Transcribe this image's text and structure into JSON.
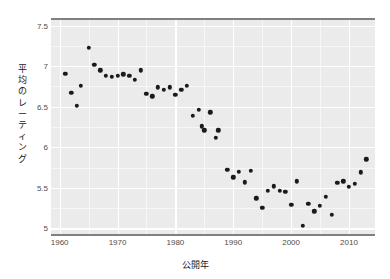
{
  "chart_data": {
    "type": "scatter",
    "title": "",
    "xlabel": "公開年",
    "ylabel": "平均のレーティング",
    "ylabel_chars": [
      "平",
      "均",
      "の",
      "レ",
      "ー",
      "テ",
      "ィ",
      "ン",
      "グ"
    ],
    "xlim": [
      1958.5,
      2014.5
    ],
    "ylim": [
      4.93,
      7.57
    ],
    "xticks": [
      1960,
      1970,
      1980,
      1990,
      2000,
      2010
    ],
    "xticklabels": [
      "1960",
      "1970",
      "1980",
      "1990",
      "2000",
      "2010"
    ],
    "yticks": [
      5,
      5.5,
      6,
      6.5,
      7,
      7.5
    ],
    "yticklabels": [
      "5",
      "5.5",
      "6",
      "6.5",
      "7",
      "7.5"
    ],
    "y_minor_ticks": [
      5.25,
      5.75,
      6.25,
      6.75,
      7.25
    ],
    "x_minor_ticks": [
      1965,
      1975,
      1985,
      1995,
      2005
    ],
    "grid": true,
    "legend": "none",
    "panel_background": "#ebebeb",
    "gridline_color": "#ffffff",
    "point_color": "#1a1a1a",
    "axis_color": "#808080",
    "x": [
      1961,
      1962,
      1963,
      1963.6,
      1965,
      1966,
      1967,
      1968,
      1969,
      1970,
      1971,
      1972,
      1973,
      1974,
      1975,
      1976,
      1977,
      1978,
      1979,
      1980,
      1981,
      1982,
      1983,
      1984,
      1984.6,
      1985,
      1986,
      1987,
      1987.4,
      1989,
      1990,
      1991,
      1992,
      1993,
      1994,
      1995,
      1996,
      1997,
      1998,
      1999,
      2000,
      2001,
      2002,
      2003,
      2004,
      2005,
      2006,
      2007,
      2008,
      2009,
      2010,
      2011,
      2012,
      2013
    ],
    "y": [
      6.91,
      6.67,
      6.51,
      6.76,
      7.23,
      7.02,
      6.95,
      6.88,
      6.87,
      6.88,
      6.9,
      6.88,
      6.83,
      6.95,
      6.66,
      6.63,
      6.74,
      6.71,
      6.74,
      6.65,
      6.71,
      6.76,
      6.39,
      6.46,
      6.26,
      6.21,
      6.43,
      6.12,
      6.21,
      5.72,
      5.63,
      5.7,
      5.57,
      5.71,
      5.37,
      5.25,
      5.46,
      5.52,
      5.46,
      5.45,
      5.29,
      5.58,
      5.03,
      5.3,
      5.21,
      5.28,
      5.39,
      5.17,
      5.56,
      5.58,
      5.51,
      5.55,
      5.69,
      5.85
    ]
  }
}
